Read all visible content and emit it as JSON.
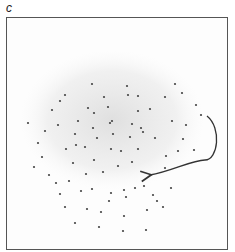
{
  "panel": {
    "label": "c"
  },
  "chart_data": {
    "type": "scatter",
    "title": "",
    "xlabel": "",
    "ylabel": "",
    "axes": "none (bounding frame only)",
    "grid": false,
    "legend": "none",
    "colors": {
      "points": "#444444",
      "haze": "#e6e6e6",
      "frame": "#555555",
      "arrow": "#333333"
    },
    "cloud": {
      "cx": 112,
      "cy": 120,
      "rx": 92,
      "ry": 70
    },
    "points": [
      [
        92,
        84
      ],
      [
        127,
        86
      ],
      [
        175,
        84
      ],
      [
        150,
        109
      ],
      [
        94,
        113
      ],
      [
        108,
        107
      ],
      [
        112,
        121
      ],
      [
        138,
        111
      ],
      [
        141,
        128
      ],
      [
        78,
        121
      ],
      [
        110,
        123
      ],
      [
        132,
        124
      ],
      [
        60,
        101
      ],
      [
        45,
        131
      ],
      [
        65,
        95
      ],
      [
        138,
        96
      ],
      [
        75,
        134
      ],
      [
        93,
        128
      ],
      [
        113,
        134
      ],
      [
        76,
        145
      ],
      [
        97,
        138
      ],
      [
        130,
        137
      ],
      [
        143,
        132
      ],
      [
        155,
        138
      ],
      [
        52,
        110
      ],
      [
        88,
        108
      ],
      [
        104,
        97
      ],
      [
        58,
        125
      ],
      [
        128,
        95
      ],
      [
        165,
        97
      ],
      [
        182,
        93
      ],
      [
        196,
        105
      ],
      [
        201,
        115
      ],
      [
        186,
        125
      ],
      [
        172,
        121
      ],
      [
        183,
        139
      ],
      [
        194,
        150
      ],
      [
        178,
        151
      ],
      [
        166,
        156
      ],
      [
        165,
        168
      ],
      [
        42,
        157
      ],
      [
        34,
        167
      ],
      [
        49,
        175
      ],
      [
        73,
        163
      ],
      [
        66,
        149
      ],
      [
        85,
        147
      ],
      [
        94,
        160
      ],
      [
        111,
        149
      ],
      [
        121,
        151
      ],
      [
        138,
        149
      ],
      [
        132,
        162
      ],
      [
        118,
        166
      ],
      [
        103,
        172
      ],
      [
        86,
        174
      ],
      [
        69,
        181
      ],
      [
        56,
        183
      ],
      [
        60,
        194
      ],
      [
        81,
        191
      ],
      [
        92,
        189
      ],
      [
        111,
        193
      ],
      [
        124,
        190
      ],
      [
        135,
        188
      ],
      [
        126,
        197
      ],
      [
        109,
        201
      ],
      [
        65,
        207
      ],
      [
        87,
        209
      ],
      [
        101,
        212
      ],
      [
        124,
        216
      ],
      [
        147,
        210
      ],
      [
        153,
        195
      ],
      [
        171,
        188
      ],
      [
        163,
        207
      ],
      [
        75,
        223
      ],
      [
        99,
        227
      ],
      [
        123,
        231
      ],
      [
        146,
        230
      ],
      [
        157,
        201
      ],
      [
        144,
        186
      ],
      [
        38,
        143
      ],
      [
        28,
        123
      ]
    ],
    "annotations": [
      {
        "type": "curved-arrow",
        "from": [
          207,
          116
        ],
        "via": [
          [
            219,
            140
          ],
          [
            205,
            160
          ],
          [
            180,
            170
          ]
        ],
        "to": [
          150,
          175
        ]
      }
    ]
  }
}
